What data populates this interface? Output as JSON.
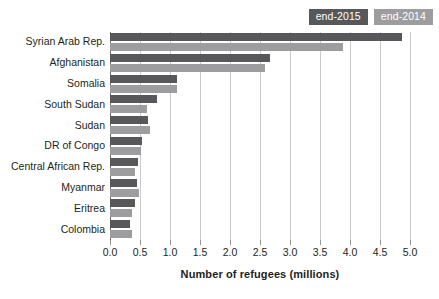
{
  "chart_data": {
    "type": "bar",
    "orientation": "horizontal",
    "title": "",
    "subtitle": "",
    "xlabel": "Number of refugees (millions)",
    "ylabel": "",
    "xlim": [
      0.0,
      5.0
    ],
    "grid": true,
    "legend_position": "top-right",
    "categories": [
      "Syrian Arab Rep.",
      "Afghanistan",
      "Somalia",
      "South Sudan",
      "Sudan",
      "DR of Congo",
      "Central African Rep.",
      "Myanmar",
      "Eritrea",
      "Colombia"
    ],
    "series": [
      {
        "name": "end-2015",
        "color": "#58585a",
        "values": [
          4.87,
          2.67,
          1.12,
          0.78,
          0.63,
          0.54,
          0.47,
          0.45,
          0.41,
          0.34
        ]
      },
      {
        "name": "end-2014",
        "color": "#9d9d9f",
        "values": [
          3.88,
          2.59,
          1.11,
          0.62,
          0.66,
          0.52,
          0.41,
          0.48,
          0.36,
          0.36
        ]
      }
    ],
    "xticks": [
      "0.0",
      "0.5",
      "1.0",
      "1.5",
      "2.0",
      "2.5",
      "3.0",
      "3.5",
      "4.0",
      "4.5",
      "5.0"
    ],
    "xtick_values": [
      0.0,
      0.5,
      1.0,
      1.5,
      2.0,
      2.5,
      3.0,
      3.5,
      4.0,
      4.5,
      5.0
    ]
  },
  "legend": {
    "items": [
      {
        "label": "end-2015",
        "color": "#58585a"
      },
      {
        "label": "end-2014",
        "color": "#9d9d9f"
      }
    ]
  },
  "colors": {
    "series_2015": "#58585a",
    "series_2014": "#9d9d9f",
    "gridline": "#c9c9c9",
    "axis": "#6d6e71",
    "text": "#231f20",
    "background": "#ffffff"
  }
}
